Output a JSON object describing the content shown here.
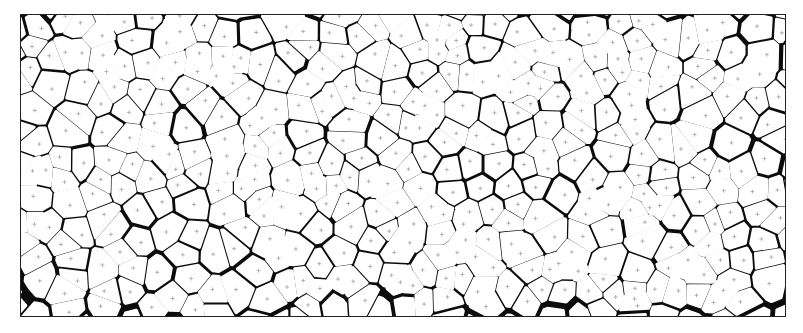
{
  "figure": {
    "type": "cellular-grain-structure",
    "colors": {
      "cells": "#ffffff",
      "background": "#0c0c0c",
      "centroid_marker": "#9a9a9a"
    },
    "frame": {
      "x": 20,
      "y": 14,
      "width": 766,
      "height": 303
    },
    "marker_glyph": "+"
  }
}
